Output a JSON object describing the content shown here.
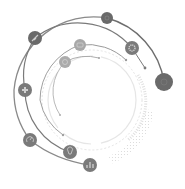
{
  "diagram": {
    "type": "circular-infographic",
    "style": "grayscale concentric orbit arcs with icon nodes",
    "colors": {
      "background": "#ffffff",
      "outer_arc": "#6e6e6e",
      "mid_arc": "#7a7a7a",
      "inner_arc": "#9a9a9a",
      "faint_arc": "#d6d6d6",
      "node_dark": "#6a6a6a",
      "node_mid": "#8a8a8a",
      "node_light": "#a8a8a8",
      "icon": "#cfcfcf"
    },
    "nodes": [
      {
        "id": "top",
        "icon": "circle-icon",
        "cx": 107,
        "cy": 18,
        "r": 6,
        "tone": "dark"
      },
      {
        "id": "far-right",
        "icon": "circle-icon",
        "cx": 164,
        "cy": 82,
        "r": 9,
        "tone": "dark"
      },
      {
        "id": "upper-left",
        "icon": "rocket-icon",
        "cx": 35,
        "cy": 38,
        "r": 7,
        "tone": "dark"
      },
      {
        "id": "gear",
        "icon": "gear-icon",
        "cx": 132,
        "cy": 48,
        "r": 7,
        "tone": "mid"
      },
      {
        "id": "inner-a",
        "icon": "chat-icon",
        "cx": 80,
        "cy": 45,
        "r": 6,
        "tone": "light"
      },
      {
        "id": "inner-b",
        "icon": "target-icon",
        "cx": 65,
        "cy": 62,
        "r": 6,
        "tone": "light"
      },
      {
        "id": "left",
        "icon": "puzzle-icon",
        "cx": 25,
        "cy": 90,
        "r": 7,
        "tone": "mid"
      },
      {
        "id": "lower-left",
        "icon": "gauge-icon",
        "cx": 30,
        "cy": 140,
        "r": 7,
        "tone": "mid"
      },
      {
        "id": "bottom",
        "icon": "lightbulb-icon",
        "cx": 70,
        "cy": 152,
        "r": 7,
        "tone": "mid"
      },
      {
        "id": "bottom-right",
        "icon": "bar-chart-icon",
        "cx": 90,
        "cy": 165,
        "r": 7,
        "tone": "mid"
      }
    ]
  }
}
